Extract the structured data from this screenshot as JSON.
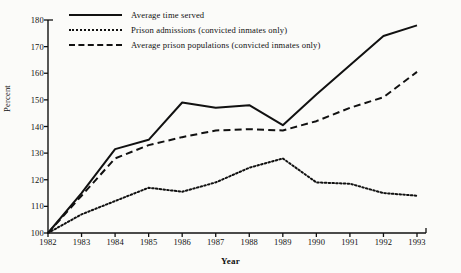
{
  "chart_data": {
    "type": "line",
    "title": "",
    "xlabel": "Year",
    "ylabel": "Percent",
    "grid": false,
    "legend_position": "top-left",
    "categories": [
      1982,
      1983,
      1984,
      1985,
      1986,
      1987,
      1988,
      1989,
      1990,
      1991,
      1992,
      1993
    ],
    "x": [
      1982,
      1983,
      1984,
      1985,
      1986,
      1987,
      1988,
      1989,
      1990,
      1991,
      1992,
      1993
    ],
    "xlim": [
      1982,
      1993
    ],
    "ylim": [
      100,
      180
    ],
    "yticks": [
      100,
      110,
      120,
      130,
      140,
      150,
      160,
      170,
      180
    ],
    "xticks": [
      "1982",
      "1983",
      "1984",
      "1985",
      "1986",
      "1987",
      "1988",
      "1989",
      "1990",
      "1991",
      "1992",
      "1993"
    ],
    "series": [
      {
        "name": "Average time served",
        "style": "solid",
        "color": "#111111",
        "values": [
          100,
          115,
          131.5,
          135,
          149,
          147,
          148,
          140.5,
          152,
          163,
          174,
          178
        ]
      },
      {
        "name": "Prison admissions (convicted inmates only)",
        "style": "dotted",
        "color": "#111111",
        "values": [
          100,
          107,
          112,
          117,
          115.5,
          119,
          124.5,
          128,
          119,
          118.5,
          115,
          114
        ]
      },
      {
        "name": "Average prison populations (convicted inmates only)",
        "style": "dashed",
        "color": "#111111",
        "values": [
          100,
          114,
          128,
          133,
          136,
          138.5,
          139,
          138.5,
          142,
          147,
          151,
          160.5
        ]
      }
    ]
  },
  "legend": {
    "items": [
      {
        "label": "Average time served",
        "style": "solid"
      },
      {
        "label": "Prison admissions (convicted inmates only)",
        "style": "dotted"
      },
      {
        "label": "Average prison populations (convicted inmates only)",
        "style": "dashed"
      }
    ]
  },
  "axes": {
    "y_title": "Percent",
    "x_title": "Year"
  }
}
